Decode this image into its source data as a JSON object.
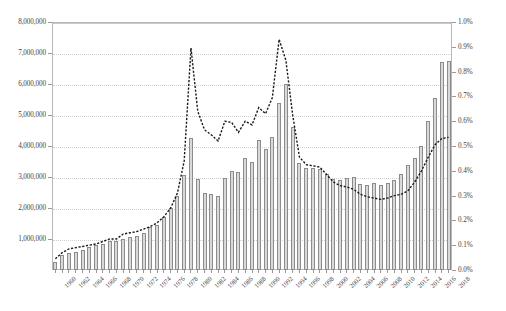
{
  "chart_data": {
    "type": "bar",
    "title": "",
    "subtitle": "",
    "xlabel": "",
    "ylabel": "",
    "y2label": "",
    "grid": true,
    "legend": "none",
    "x_tick_step": 2,
    "x": [
      1960,
      1961,
      1962,
      1963,
      1964,
      1965,
      1966,
      1967,
      1968,
      1969,
      1970,
      1971,
      1972,
      1973,
      1974,
      1975,
      1976,
      1977,
      1978,
      1979,
      1980,
      1981,
      1982,
      1983,
      1984,
      1985,
      1986,
      1987,
      1988,
      1989,
      1990,
      1991,
      1992,
      1993,
      1994,
      1995,
      1996,
      1997,
      1998,
      1999,
      2000,
      2001,
      2002,
      2003,
      2004,
      2005,
      2006,
      2007,
      2008,
      2009,
      2010,
      2011,
      2012,
      2013,
      2014,
      2015,
      2016,
      2017,
      2018
    ],
    "x_tick_labels": [
      "1960",
      "1962",
      "1964",
      "1966",
      "1968",
      "1970",
      "1972",
      "1974",
      "1976",
      "1978",
      "1980",
      "1982",
      "1984",
      "1986",
      "1988",
      "1990",
      "1992",
      "1994",
      "1996",
      "1998",
      "2000",
      "2002",
      "2004",
      "2006",
      "2008",
      "2010",
      "2012",
      "2014",
      "2016",
      "2018"
    ],
    "ylim": [
      0,
      8000000
    ],
    "y_tick_labels": [
      "8,000,000",
      "7,000,000",
      "6,000,000",
      "5,000,000",
      "4,000,000",
      "3,000,000",
      "2,000,000",
      "1,000,000"
    ],
    "y_tick_values": [
      8000000,
      7000000,
      6000000,
      5000000,
      4000000,
      3000000,
      2000000,
      1000000
    ],
    "y2lim": [
      0,
      1.0
    ],
    "y2_tick_labels": [
      "1.0%",
      "0.9%",
      "0.8%",
      "0.7%",
      "0.6%",
      "0.5%",
      "0.4%",
      "0.3%",
      "0.2%",
      "0.1%",
      "0.0%"
    ],
    "y2_tick_values": [
      1.0,
      0.9,
      0.8,
      0.7,
      0.6,
      0.5,
      0.4,
      0.3,
      0.2,
      0.1,
      0.0
    ],
    "series": [
      {
        "name": "bars",
        "axis": "left",
        "render": "bar",
        "color": "#d9d9d9",
        "edge_color": "#8c8c8c",
        "values": [
          265000,
          500000,
          560000,
          570000,
          640000,
          740000,
          820000,
          840000,
          930000,
          950000,
          1000000,
          1070000,
          1100000,
          1180000,
          1380000,
          1450000,
          1700000,
          2000000,
          2400000,
          3080000,
          4250000,
          2940000,
          2500000,
          2450000,
          2400000,
          2980000,
          3200000,
          3150000,
          3600000,
          3500000,
          4200000,
          3900000,
          4300000,
          5400000,
          6000000,
          4600000,
          3450000,
          3300000,
          3300000,
          3250000,
          3100000,
          2920000,
          2900000,
          2960000,
          3000000,
          2780000,
          2750000,
          2800000,
          2740000,
          2800000,
          2900000,
          3100000,
          3400000,
          3620000,
          4000000,
          4800000,
          5550000,
          6700000,
          6750000
        ]
      },
      {
        "name": "line",
        "axis": "right",
        "render": "line",
        "color": "#1a1a1a",
        "style": "dashed",
        "values": [
          0.045,
          0.07,
          0.085,
          0.09,
          0.095,
          0.1,
          0.105,
          0.115,
          0.125,
          0.125,
          0.145,
          0.15,
          0.155,
          0.165,
          0.175,
          0.19,
          0.215,
          0.25,
          0.31,
          0.44,
          0.895,
          0.64,
          0.565,
          0.545,
          0.52,
          0.6,
          0.595,
          0.555,
          0.6,
          0.585,
          0.655,
          0.63,
          0.695,
          0.93,
          0.845,
          0.625,
          0.455,
          0.425,
          0.42,
          0.415,
          0.385,
          0.355,
          0.34,
          0.335,
          0.325,
          0.305,
          0.295,
          0.29,
          0.285,
          0.29,
          0.3,
          0.305,
          0.32,
          0.355,
          0.4,
          0.455,
          0.505,
          0.53,
          0.535
        ]
      }
    ]
  }
}
